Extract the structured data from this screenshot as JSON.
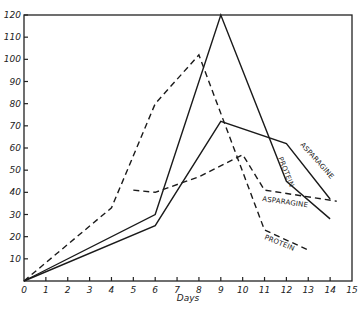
{
  "chart_data": {
    "type": "line",
    "title": "",
    "xlabel": "Days",
    "ylabel": "",
    "xlim": [
      0,
      15
    ],
    "ylim": [
      0,
      120
    ],
    "x_ticks": [
      0,
      1,
      2,
      3,
      4,
      5,
      6,
      7,
      8,
      9,
      10,
      11,
      12,
      13,
      14,
      15
    ],
    "y_ticks": [
      10,
      20,
      30,
      40,
      50,
      60,
      70,
      80,
      90,
      100,
      110,
      120
    ],
    "grid": false,
    "legend": "inline line labels",
    "series": [
      {
        "name": "PROTEIN",
        "style": "solid",
        "x": [
          0,
          6,
          9,
          12,
          14
        ],
        "values": [
          0,
          30,
          120,
          45,
          28
        ]
      },
      {
        "name": "ASPARAGINE",
        "style": "solid",
        "x": [
          0,
          6,
          9,
          12,
          14
        ],
        "values": [
          0,
          25,
          72,
          62,
          37
        ]
      },
      {
        "name": "PROTEIN",
        "style": "dashed",
        "x": [
          0,
          4,
          6,
          8,
          11,
          13
        ],
        "values": [
          0,
          33,
          80,
          102,
          23,
          14
        ]
      },
      {
        "name": "ASPARAGINE",
        "style": "dashed",
        "x": [
          5,
          6,
          8,
          10,
          11,
          14.3
        ],
        "values": [
          41,
          40,
          47,
          57,
          41,
          36
        ]
      }
    ]
  },
  "labels": {
    "x_axis": "Days",
    "solid_protein": "PROTEIN",
    "solid_asparagine": "ASPARAGINE",
    "dashed_protein": "PROTEIN",
    "dashed_asparagine": "ASPARAGINE"
  }
}
